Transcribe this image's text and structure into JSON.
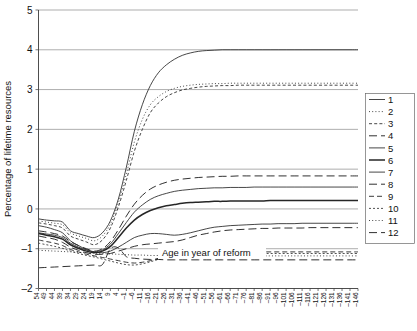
{
  "chart_data": {
    "type": "line",
    "title": "",
    "xlabel": "Age in year of reform",
    "ylabel": "Percentage of lifetime resources",
    "ylim": [
      -2,
      5
    ],
    "yticks": [
      -2,
      -1,
      0,
      1,
      2,
      3,
      4,
      5
    ],
    "ytick_labels": [
      "–2",
      "–1",
      "0",
      "1",
      "2",
      "3",
      "4",
      "5"
    ],
    "grid": true,
    "legend_position": "right",
    "x_start": 54,
    "x_step": -5,
    "x": [
      54,
      49,
      44,
      39,
      34,
      29,
      24,
      19,
      14,
      9,
      4,
      -1,
      -6,
      -11,
      -16,
      -21,
      -26,
      -31,
      -36,
      -41,
      -46,
      -51,
      -56,
      -61,
      -66,
      -71,
      -76,
      -81,
      -86,
      -91,
      -96,
      -101,
      -106,
      -111,
      -116,
      -121,
      -126,
      -131,
      -136,
      -141,
      -146
    ],
    "xtick_labels": [
      "54",
      "49",
      "44",
      "39",
      "34",
      "29",
      "24",
      "19",
      "14",
      "9",
      "4",
      "–1",
      "–6",
      "–11",
      "–16",
      "–21",
      "–26",
      "–31",
      "–36",
      "–41",
      "–46",
      "–51",
      "–56",
      "–61",
      "–66",
      "–71",
      "–76",
      "–81",
      "–86",
      "–91",
      "–96",
      "–101",
      "–106",
      "–111",
      "–116",
      "–121",
      "–126",
      "–131",
      "–136",
      "–141",
      "–146"
    ],
    "legend_entries": [
      {
        "label": "1",
        "style": "solid"
      },
      {
        "label": "2",
        "style": "dotted"
      },
      {
        "label": "3",
        "style": "dashed-short"
      },
      {
        "label": "4",
        "style": "dashed-long"
      },
      {
        "label": "5",
        "style": "solid"
      },
      {
        "label": "6",
        "style": "solid-thick"
      },
      {
        "label": "7",
        "style": "solid"
      },
      {
        "label": "8",
        "style": "dashed-long"
      },
      {
        "label": "9",
        "style": "dashed-med"
      },
      {
        "label": "10",
        "style": "dashed-fine"
      },
      {
        "label": "11",
        "style": "dotted"
      },
      {
        "label": "12",
        "style": "dashed-long"
      }
    ],
    "series": [
      {
        "name": "1",
        "style": "solid",
        "values": [
          -0.25,
          -0.28,
          -0.3,
          -0.33,
          -0.55,
          -0.62,
          -0.68,
          -0.72,
          -0.6,
          -0.3,
          0.25,
          1.05,
          1.95,
          2.62,
          3.1,
          3.42,
          3.62,
          3.76,
          3.86,
          3.92,
          3.96,
          3.98,
          3.99,
          4.0,
          4.0,
          4.0,
          4.0,
          4.0,
          4.0,
          4.0,
          4.0,
          4.0,
          4.0,
          4.0,
          4.0,
          4.0,
          4.0,
          4.0,
          4.0,
          4.0,
          4.0
        ]
      },
      {
        "name": "2",
        "style": "dotted",
        "values": [
          -0.3,
          -0.33,
          -0.36,
          -0.4,
          -0.6,
          -0.68,
          -0.74,
          -0.8,
          -0.68,
          -0.38,
          0.15,
          0.88,
          1.68,
          2.25,
          2.62,
          2.82,
          2.95,
          3.03,
          3.08,
          3.11,
          3.13,
          3.14,
          3.15,
          3.15,
          3.16,
          3.16,
          3.16,
          3.16,
          3.16,
          3.16,
          3.16,
          3.16,
          3.16,
          3.16,
          3.16,
          3.16,
          3.16,
          3.16,
          3.16,
          3.16,
          3.16
        ]
      },
      {
        "name": "3",
        "style": "dashed-short",
        "values": [
          -0.35,
          -0.38,
          -0.42,
          -0.48,
          -0.68,
          -0.76,
          -0.83,
          -0.9,
          -0.78,
          -0.48,
          0.05,
          0.72,
          1.45,
          2.0,
          2.42,
          2.66,
          2.82,
          2.92,
          2.99,
          3.03,
          3.06,
          3.08,
          3.09,
          3.1,
          3.1,
          3.11,
          3.11,
          3.11,
          3.11,
          3.11,
          3.11,
          3.11,
          3.11,
          3.11,
          3.11,
          3.11,
          3.11,
          3.11,
          3.11,
          3.11,
          3.11
        ]
      },
      {
        "name": "4",
        "style": "dashed-long",
        "values": [
          -0.55,
          -0.58,
          -0.62,
          -0.68,
          -0.82,
          -0.92,
          -1.0,
          -1.06,
          -1.0,
          -0.82,
          -0.52,
          -0.18,
          0.12,
          0.34,
          0.5,
          0.6,
          0.67,
          0.72,
          0.75,
          0.77,
          0.79,
          0.8,
          0.81,
          0.82,
          0.82,
          0.83,
          0.83,
          0.83,
          0.83,
          0.83,
          0.83,
          0.83,
          0.83,
          0.83,
          0.83,
          0.83,
          0.83,
          0.83,
          0.83,
          0.83,
          0.83
        ]
      },
      {
        "name": "5",
        "style": "solid",
        "values": [
          -0.6,
          -0.63,
          -0.66,
          -0.72,
          -0.86,
          -0.96,
          -1.03,
          -1.08,
          -1.03,
          -0.88,
          -0.62,
          -0.34,
          -0.08,
          0.1,
          0.24,
          0.33,
          0.39,
          0.44,
          0.47,
          0.49,
          0.51,
          0.52,
          0.53,
          0.53,
          0.54,
          0.54,
          0.54,
          0.55,
          0.55,
          0.55,
          0.55,
          0.55,
          0.55,
          0.55,
          0.55,
          0.55,
          0.55,
          0.55,
          0.55,
          0.55,
          0.55
        ]
      },
      {
        "name": "6",
        "style": "solid-thick",
        "values": [
          -0.62,
          -0.66,
          -0.7,
          -0.76,
          -0.9,
          -0.99,
          -1.06,
          -1.1,
          -1.06,
          -0.94,
          -0.72,
          -0.48,
          -0.28,
          -0.14,
          -0.04,
          0.03,
          0.08,
          0.11,
          0.14,
          0.16,
          0.17,
          0.18,
          0.19,
          0.19,
          0.2,
          0.2,
          0.2,
          0.2,
          0.2,
          0.21,
          0.21,
          0.21,
          0.21,
          0.21,
          0.21,
          0.21,
          0.21,
          0.21,
          0.21,
          0.21,
          0.21
        ]
      },
      {
        "name": "7",
        "style": "solid",
        "values": [
          -0.42,
          -0.46,
          -0.52,
          -0.6,
          -0.8,
          -0.92,
          -1.02,
          -1.08,
          -1.1,
          -1.06,
          -0.96,
          -0.84,
          -0.72,
          -0.66,
          -0.62,
          -0.62,
          -0.64,
          -0.66,
          -0.64,
          -0.6,
          -0.55,
          -0.5,
          -0.46,
          -0.44,
          -0.42,
          -0.41,
          -0.4,
          -0.39,
          -0.38,
          -0.38,
          -0.37,
          -0.37,
          -0.37,
          -0.36,
          -0.36,
          -0.36,
          -0.36,
          -0.36,
          -0.36,
          -0.36,
          -0.36
        ]
      },
      {
        "name": "8",
        "style": "dashed-long",
        "values": [
          -0.68,
          -0.72,
          -0.76,
          -0.84,
          -0.96,
          -1.04,
          -1.1,
          -1.14,
          -1.14,
          -1.12,
          -1.06,
          -1.0,
          -0.94,
          -0.9,
          -0.88,
          -0.86,
          -0.84,
          -0.82,
          -0.78,
          -0.72,
          -0.66,
          -0.62,
          -0.58,
          -0.55,
          -0.53,
          -0.52,
          -0.51,
          -0.5,
          -0.49,
          -0.49,
          -0.48,
          -0.48,
          -0.48,
          -0.48,
          -0.47,
          -0.47,
          -0.47,
          -0.47,
          -0.47,
          -0.47,
          -0.47
        ]
      },
      {
        "name": "9",
        "style": "dashed-med",
        "values": [
          -0.78,
          -0.82,
          -0.86,
          -0.92,
          -1.02,
          -1.08,
          -1.14,
          -1.18,
          -1.22,
          -1.26,
          -1.3,
          -1.34,
          -1.36,
          -1.34,
          -1.3,
          -1.24,
          -1.18,
          -1.14,
          -1.12,
          -1.11,
          -1.1,
          -1.1,
          -1.09,
          -1.09,
          -1.09,
          -1.08,
          -1.08,
          -1.08,
          -1.08,
          -1.08,
          -1.08,
          -1.08,
          -1.08,
          -1.08,
          -1.08,
          -1.08,
          -1.08,
          -1.08,
          -1.08,
          -1.08,
          -1.08
        ]
      },
      {
        "name": "10",
        "style": "dashed-fine",
        "values": [
          -0.86,
          -0.9,
          -0.94,
          -0.99,
          -1.06,
          -1.12,
          -1.17,
          -1.21,
          -1.26,
          -1.31,
          -1.36,
          -1.4,
          -1.41,
          -1.38,
          -1.33,
          -1.27,
          -1.22,
          -1.18,
          -1.16,
          -1.15,
          -1.14,
          -1.14,
          -1.13,
          -1.13,
          -1.13,
          -1.13,
          -1.12,
          -1.12,
          -1.12,
          -1.12,
          -1.12,
          -1.12,
          -1.12,
          -1.12,
          -1.12,
          -1.12,
          -1.12,
          -1.12,
          -1.12,
          -1.12,
          -1.12
        ]
      },
      {
        "name": "11",
        "style": "dotted",
        "values": [
          -1.04,
          -1.05,
          -1.06,
          -1.07,
          -1.08,
          -1.09,
          -1.1,
          -1.11,
          -1.12,
          -1.13,
          -1.14,
          -1.15,
          -1.16,
          -1.16,
          -1.17,
          -1.17,
          -1.17,
          -1.18,
          -1.18,
          -1.18,
          -1.18,
          -1.18,
          -1.18,
          -1.18,
          -1.18,
          -1.18,
          -1.18,
          -1.18,
          -1.18,
          -1.18,
          -1.18,
          -1.18,
          -1.18,
          -1.18,
          -1.18,
          -1.18,
          -1.18,
          -1.18,
          -1.18,
          -1.18,
          -1.18
        ]
      },
      {
        "name": "12",
        "style": "dashed-long",
        "values": [
          -1.48,
          -1.47,
          -1.46,
          -1.45,
          -1.44,
          -1.43,
          -1.42,
          -1.41,
          -1.4,
          -1.0,
          -0.98,
          -1.2,
          -1.24,
          -1.26,
          -1.27,
          -1.27,
          -1.28,
          -1.28,
          -1.28,
          -1.28,
          -1.28,
          -1.28,
          -1.28,
          -1.28,
          -1.28,
          -1.28,
          -1.28,
          -1.28,
          -1.28,
          -1.28,
          -1.28,
          -1.28,
          -1.28,
          -1.28,
          -1.28,
          -1.28,
          -1.28,
          -1.28,
          -1.28,
          -1.28,
          -1.28
        ]
      }
    ]
  },
  "annotation": {
    "text": "Age in year of reform"
  }
}
